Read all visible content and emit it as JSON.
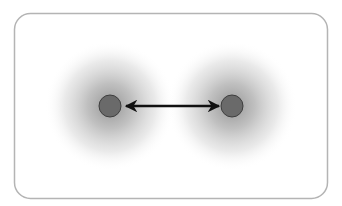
{
  "diagram": {
    "frame": {
      "x": 14,
      "y": 13,
      "width": 314,
      "height": 186,
      "radius": 16,
      "stroke": "#b4b4b4"
    },
    "atoms": [
      {
        "id": "atom-left",
        "cx": 110,
        "cy": 106,
        "nucleus_r": 11,
        "cloud_r": 64
      },
      {
        "id": "atom-right",
        "cx": 232,
        "cy": 106,
        "nucleus_r": 11,
        "cloud_r": 64
      }
    ],
    "arrow": {
      "x1": 124,
      "y1": 106,
      "x2": 219,
      "y2": 106,
      "double_headed": true,
      "color": "#111111"
    },
    "colors": {
      "nucleus_fill": "#6a6a6a",
      "nucleus_stroke": "#3e3e3e",
      "cloud_inner": "#9a9a9a",
      "cloud_outer": "#ffffff"
    }
  }
}
